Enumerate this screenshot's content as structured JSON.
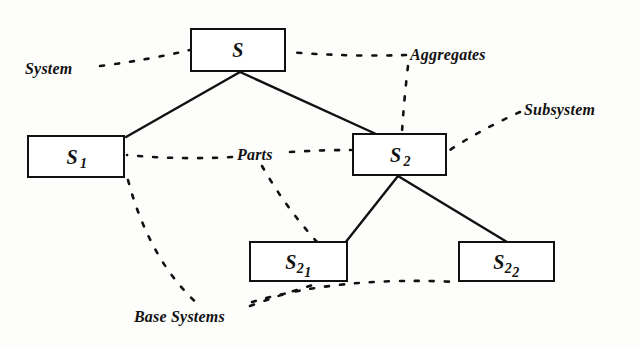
{
  "figure": {
    "background_color": "#fdfdfc",
    "line_color": "#111111"
  },
  "nodes": [
    {
      "id": "s",
      "label_base": "S",
      "label_sub": "",
      "label_sub2": "",
      "x": 190,
      "y": 28,
      "w": 96,
      "h": 44
    },
    {
      "id": "s1",
      "label_base": "S",
      "label_sub": "1",
      "label_sub2": "",
      "x": 27,
      "y": 135,
      "w": 98,
      "h": 43
    },
    {
      "id": "s2",
      "label_base": "S",
      "label_sub": "2",
      "label_sub2": "",
      "x": 352,
      "y": 133,
      "w": 95,
      "h": 43
    },
    {
      "id": "s21",
      "label_base": "S",
      "label_sub": "2",
      "label_sub2": "1",
      "x": 249,
      "y": 241,
      "w": 99,
      "h": 41
    },
    {
      "id": "s22",
      "label_base": "S",
      "label_sub": "2",
      "label_sub2": "2",
      "x": 458,
      "y": 241,
      "w": 97,
      "h": 41
    }
  ],
  "annotations": [
    {
      "id": "system",
      "text": "System",
      "x": 25,
      "y": 60
    },
    {
      "id": "aggregates",
      "text": "Aggregates",
      "x": 410,
      "y": 46
    },
    {
      "id": "subsystem",
      "text": "Subsystem",
      "x": 524,
      "y": 101
    },
    {
      "id": "parts",
      "text": "Parts",
      "x": 237,
      "y": 146
    },
    {
      "id": "base-systems",
      "text": "Base Systems",
      "x": 134,
      "y": 308
    }
  ],
  "solid_edges": [
    {
      "id": "s-to-s1",
      "from": "s",
      "to": "s1"
    },
    {
      "id": "s-to-s2",
      "from": "s",
      "to": "s2"
    },
    {
      "id": "s2-to-s21",
      "from": "s2",
      "to": "s21"
    },
    {
      "id": "s2-to-s22",
      "from": "s2",
      "to": "s22"
    }
  ],
  "dashed_links": [
    {
      "id": "system-to-s",
      "from": "system",
      "to": "s"
    },
    {
      "id": "aggregates-to-s",
      "from": "aggregates",
      "to": "s"
    },
    {
      "id": "aggregates-to-s2",
      "from": "aggregates",
      "to": "s2"
    },
    {
      "id": "subsystem-to-s2",
      "from": "subsystem",
      "to": "s2"
    },
    {
      "id": "parts-to-s1",
      "from": "parts",
      "to": "s1"
    },
    {
      "id": "parts-to-s2",
      "from": "parts",
      "to": "s2"
    },
    {
      "id": "parts-to-s21",
      "from": "parts",
      "to": "s21"
    },
    {
      "id": "base-systems-to-s1",
      "from": "base-systems",
      "to": "s1"
    },
    {
      "id": "base-systems-to-s21",
      "from": "base-systems",
      "to": "s21"
    },
    {
      "id": "base-systems-to-s22",
      "from": "base-systems",
      "to": "s22"
    }
  ]
}
